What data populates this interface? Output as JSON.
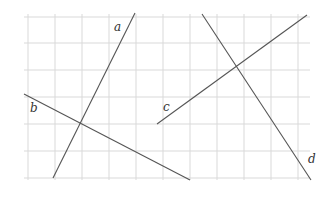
{
  "diagram": {
    "type": "lines-on-grid",
    "grid": {
      "x_lines": [
        28,
        55,
        82,
        109,
        136,
        163,
        190,
        217,
        244,
        271,
        298
      ],
      "y_lines": [
        17,
        43,
        70,
        97,
        124,
        151,
        178
      ],
      "x_min": 24,
      "x_max": 310,
      "y_min": 14,
      "y_max": 180,
      "color": "#d9d9d9"
    },
    "line_color": "#555555",
    "lines": [
      {
        "id": "a",
        "label": "a",
        "x1": 135,
        "y1": 13,
        "x2": 53,
        "y2": 178,
        "label_x": 114,
        "label_y": 31
      },
      {
        "id": "b",
        "label": "b",
        "x1": 24,
        "y1": 94,
        "x2": 190,
        "y2": 180,
        "label_x": 30,
        "label_y": 112
      },
      {
        "id": "c",
        "label": "c",
        "x1": 157,
        "y1": 124,
        "x2": 307,
        "y2": 15,
        "label_x": 163,
        "label_y": 111
      },
      {
        "id": "d",
        "label": "d",
        "x1": 202,
        "y1": 14,
        "x2": 311,
        "y2": 180,
        "label_x": 308,
        "label_y": 163
      }
    ]
  }
}
